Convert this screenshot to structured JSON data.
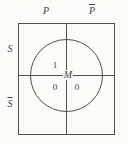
{
  "diagram": {
    "column_labels": [
      {
        "text": "P",
        "negated": false
      },
      {
        "text": "P",
        "negated": true
      }
    ],
    "row_labels": [
      {
        "text": "S",
        "negated": false
      },
      {
        "text": "S",
        "negated": true
      }
    ],
    "circle_label": "M",
    "cells": [
      {
        "region": "circle-upper-left",
        "value": "1"
      },
      {
        "region": "circle-lower-left",
        "value": "0"
      },
      {
        "region": "circle-lower-right",
        "value": "0"
      }
    ],
    "colors": {
      "line": "#4f4f4f",
      "text": "#454545",
      "background": "#fbfbf9"
    }
  }
}
